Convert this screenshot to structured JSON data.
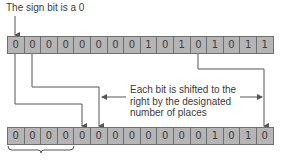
{
  "title": "The sign bit is a 0",
  "original_register": {
    "bits": [
      "0",
      "0",
      "0",
      "0",
      "0",
      "0",
      "0",
      "0",
      "1",
      "0",
      "1",
      "0",
      "1",
      "0",
      "1",
      "1"
    ]
  },
  "shifted_register": {
    "bits": [
      "0",
      "0",
      "0",
      "0",
      "0",
      "0",
      "0",
      "0",
      "0",
      "0",
      "0",
      "0",
      "1",
      "0",
      "1",
      "0"
    ]
  },
  "annotation": {
    "line1": "Each bit is shifted to the",
    "line2": "right by the designated",
    "line3": "number of places"
  },
  "colors": {
    "cell_fill": "#b5b5b5",
    "cell_border": "#6f6f6f",
    "wire": "#555555"
  }
}
